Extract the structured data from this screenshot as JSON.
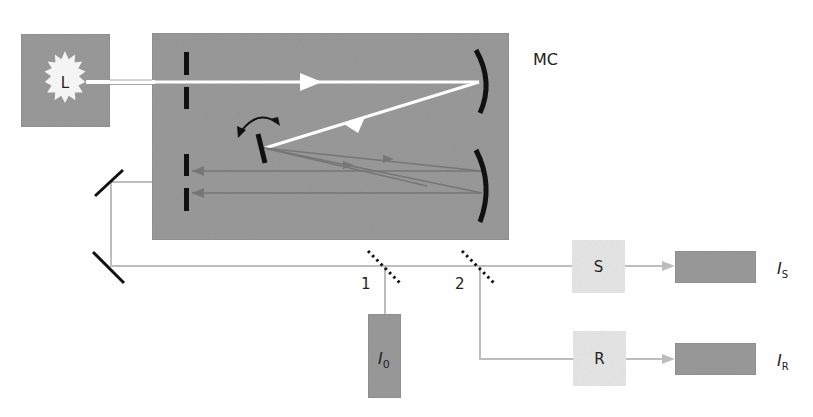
{
  "diagram": {
    "type": "monochromator optical setup",
    "colors": {
      "box_dark": "#9a9a9a",
      "box_light": "#e6e6e6",
      "beam_white": "#ffffff",
      "beam_inner": "#7a7a7a",
      "beam_outer": "#bdbdbd",
      "element": "#111111",
      "text": "#222222"
    },
    "labels": {
      "lamp": "L",
      "monochromator": "MC",
      "splitter_1": "1",
      "splitter_2": "2",
      "sample": "S",
      "reference": "R",
      "detector_0_main": "I",
      "detector_0_sub": "0",
      "detector_s_main": "I",
      "detector_s_sub": "S",
      "detector_r_main": "I",
      "detector_r_sub": "R"
    }
  }
}
